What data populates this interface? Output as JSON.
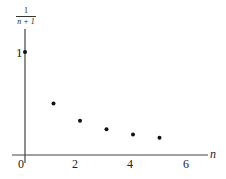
{
  "chart_data": {
    "type": "scatter",
    "title": "",
    "xlabel": "n",
    "ylabel": "1/(n+1)",
    "ylabel_num": "1",
    "ylabel_den": "n + 1",
    "x_ticks": [
      "0",
      "2",
      "4",
      "6"
    ],
    "y_ticks": [
      "1"
    ],
    "xlim": [
      0,
      7
    ],
    "ylim": [
      0,
      1.3
    ],
    "grid": false,
    "series": [
      {
        "name": "1/(n+1)",
        "x": [
          0,
          1,
          2,
          3,
          4,
          5
        ],
        "y": [
          1,
          0.5,
          0.333,
          0.25,
          0.2,
          0.167
        ]
      }
    ]
  }
}
